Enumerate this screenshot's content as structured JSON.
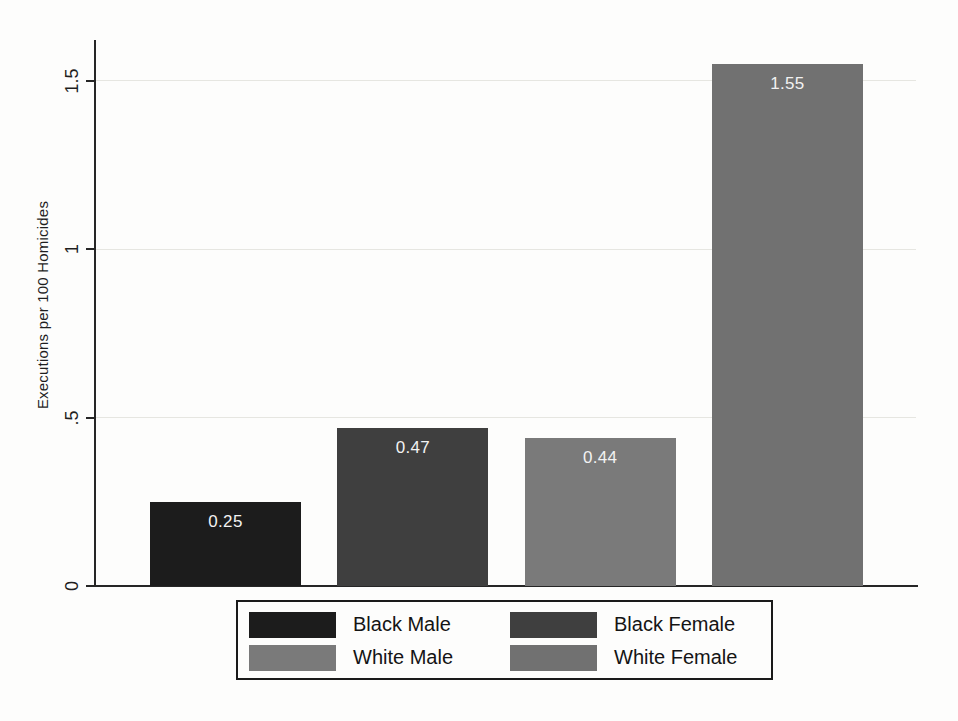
{
  "chart_data": {
    "type": "bar",
    "title": "",
    "xlabel": "",
    "ylabel": "Executions per 100 Homicides",
    "categories": [
      "Black Male",
      "Black Female",
      "White Male",
      "White Female"
    ],
    "values": [
      0.25,
      0.47,
      0.44,
      1.55
    ],
    "bar_labels": [
      "0.25",
      "0.47",
      "0.44",
      "1.55"
    ],
    "bar_label_color": "#f2f2f2",
    "colors": [
      "#1c1c1c",
      "#3f3f3f",
      "#7a7a7a",
      "#717171"
    ],
    "ylim": [
      0,
      1.62
    ],
    "yticks": [
      0,
      0.5,
      1,
      1.5
    ],
    "ytick_labels": [
      "0",
      ".5",
      "1",
      "1.5"
    ],
    "grid": true,
    "legend_position": "bottom",
    "legend": [
      {
        "label": "Black Male",
        "color": "#1c1c1c"
      },
      {
        "label": "Black Female",
        "color": "#3f3f3f"
      },
      {
        "label": "White Male",
        "color": "#7a7a7a"
      },
      {
        "label": "White Female",
        "color": "#717171"
      }
    ]
  }
}
